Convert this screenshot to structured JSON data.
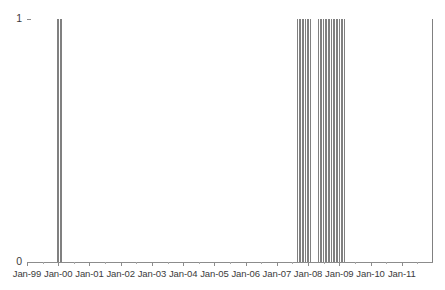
{
  "chart_data": {
    "type": "bar",
    "title": "",
    "subtitle": "",
    "xlabel": "",
    "ylabel": "",
    "xlim": [
      "Jan-99",
      "Jan-12"
    ],
    "ylim": [
      0,
      1
    ],
    "grid": false,
    "legend": null,
    "bar_color": "#808080",
    "axis_color": "#8c8c8c",
    "ytick_labels": [
      "0",
      "1"
    ],
    "ytick_values": [
      0,
      1
    ],
    "xtick_labels": [
      "Jan-99",
      "Jan-00",
      "Jan-01",
      "Jan-02",
      "Jan-03",
      "Jan-04",
      "Jan-05",
      "Jan-06",
      "Jan-07",
      "Jan-08",
      "Jan-09",
      "Jan-10",
      "Jan-11"
    ],
    "xtick_values": [
      0,
      12,
      24,
      36,
      48,
      60,
      72,
      84,
      96,
      108,
      120,
      132,
      144
    ],
    "x_total_months": 157,
    "categories": [
      "Jan-99",
      "Feb-99",
      "Mar-99",
      "Apr-99",
      "May-99",
      "Jun-99",
      "Jul-99",
      "Aug-99",
      "Sep-99",
      "Oct-99",
      "Nov-99",
      "Dec-99",
      "Jan-00",
      "Feb-00",
      "Mar-00",
      "Apr-00",
      "May-00",
      "Jun-00",
      "Jul-00",
      "Aug-00",
      "Sep-00",
      "Oct-00",
      "Nov-00",
      "Dec-00",
      "Jan-01",
      "Feb-01",
      "Mar-01",
      "Apr-01",
      "May-01",
      "Jun-01",
      "Jul-01",
      "Aug-01",
      "Sep-01",
      "Oct-01",
      "Nov-01",
      "Dec-01",
      "Jan-02",
      "Feb-02",
      "Mar-02",
      "Apr-02",
      "May-02",
      "Jun-02",
      "Jul-02",
      "Aug-02",
      "Sep-02",
      "Oct-02",
      "Nov-02",
      "Dec-02",
      "Jan-03",
      "Feb-03",
      "Mar-03",
      "Apr-03",
      "May-03",
      "Jun-03",
      "Jul-03",
      "Aug-03",
      "Sep-03",
      "Oct-03",
      "Nov-03",
      "Dec-03",
      "Jan-04",
      "Feb-04",
      "Mar-04",
      "Apr-04",
      "May-04",
      "Jun-04",
      "Jul-04",
      "Aug-04",
      "Sep-04",
      "Oct-04",
      "Nov-04",
      "Dec-04",
      "Jan-05",
      "Feb-05",
      "Mar-05",
      "Apr-05",
      "May-05",
      "Jun-05",
      "Jul-05",
      "Aug-05",
      "Sep-05",
      "Oct-05",
      "Nov-05",
      "Dec-05",
      "Jan-06",
      "Feb-06",
      "Mar-06",
      "Apr-06",
      "May-06",
      "Jun-06",
      "Jul-06",
      "Aug-06",
      "Sep-06",
      "Oct-06",
      "Nov-06",
      "Dec-06",
      "Jan-07",
      "Feb-07",
      "Mar-07",
      "Apr-07",
      "May-07",
      "Jun-07",
      "Jul-07",
      "Aug-07",
      "Sep-07",
      "Oct-07",
      "Nov-07",
      "Dec-07",
      "Jan-08",
      "Feb-08",
      "Mar-08",
      "Apr-08",
      "May-08",
      "Jun-08",
      "Jul-08",
      "Aug-08",
      "Sep-08",
      "Oct-08",
      "Nov-08",
      "Dec-08",
      "Jan-09",
      "Feb-09",
      "Mar-09",
      "Apr-09",
      "May-09",
      "Jun-09",
      "Jul-09",
      "Aug-09",
      "Sep-09",
      "Oct-09",
      "Nov-09",
      "Dec-09",
      "Jan-10",
      "Feb-10",
      "Mar-10",
      "Apr-10",
      "May-10",
      "Jun-10",
      "Jul-10",
      "Aug-10",
      "Sep-10",
      "Oct-10",
      "Nov-10",
      "Dec-10",
      "Jan-11",
      "Feb-11",
      "Mar-11",
      "Apr-11",
      "May-11",
      "Jun-11",
      "Jul-11",
      "Aug-11",
      "Sep-11",
      "Oct-11",
      "Nov-11",
      "Dec-11",
      "Jan-12"
    ],
    "values": [
      0,
      0,
      0,
      0,
      0,
      0,
      0,
      0,
      0,
      0,
      0,
      0,
      1,
      1,
      0,
      0,
      0,
      0,
      0,
      0,
      0,
      0,
      0,
      0,
      0,
      0,
      0,
      0,
      0,
      0,
      0,
      0,
      0,
      0,
      0,
      0,
      0,
      0,
      0,
      0,
      0,
      0,
      0,
      0,
      0,
      0,
      0,
      0,
      0,
      0,
      0,
      0,
      0,
      0,
      0,
      0,
      0,
      0,
      0,
      0,
      0,
      0,
      0,
      0,
      0,
      0,
      0,
      0,
      0,
      0,
      0,
      0,
      0,
      0,
      0,
      0,
      0,
      0,
      0,
      0,
      0,
      0,
      0,
      0,
      0,
      0,
      0,
      0,
      0,
      0,
      0,
      0,
      0,
      0,
      0,
      0,
      0,
      0,
      0,
      0,
      0,
      0,
      0,
      0,
      1,
      1,
      1,
      1,
      1,
      1,
      0,
      0,
      1,
      1,
      1,
      1,
      1,
      1,
      1,
      1,
      1,
      1,
      1,
      0,
      0,
      0,
      0,
      0,
      0,
      0,
      0,
      0,
      0,
      0,
      0,
      0,
      0,
      0,
      0,
      0,
      0,
      0,
      0,
      0,
      0,
      0,
      0,
      0,
      0,
      0,
      0,
      0,
      0,
      0,
      0,
      0,
      1
    ]
  }
}
